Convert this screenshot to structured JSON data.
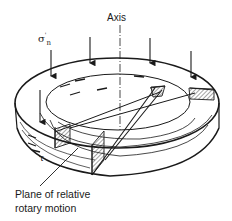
{
  "diagram": {
    "labels": {
      "axis": "Axis",
      "normal_stress": "σ",
      "normal_stress_prime": "'",
      "normal_stress_sub": "n",
      "shear_stress": "τ",
      "plane_line1": "Plane of relative",
      "plane_line2": "rotary motion"
    },
    "arrows": {
      "normal_stress_count": 5,
      "direction": "down"
    },
    "colors": {
      "stroke": "#1a1a1a",
      "background": "#ffffff"
    }
  }
}
